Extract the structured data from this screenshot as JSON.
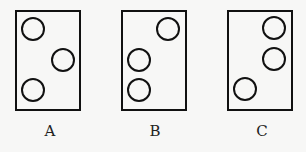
{
  "panels": [
    {
      "label": "A",
      "box": {
        "x": 16,
        "y": 11,
        "w": 64,
        "h": 99
      },
      "circles": [
        [
          33,
          29
        ],
        [
          63,
          60
        ],
        [
          33,
          90
        ]
      ],
      "label_x": 50
    },
    {
      "label": "B",
      "box": {
        "x": 122,
        "y": 11,
        "w": 64,
        "h": 99
      },
      "circles": [
        [
          168,
          29
        ],
        [
          139,
          60
        ],
        [
          139,
          90
        ]
      ],
      "label_x": 155
    },
    {
      "label": "C",
      "box": {
        "x": 228,
        "y": 11,
        "w": 64,
        "h": 99
      },
      "circles": [
        [
          274,
          28
        ],
        [
          274,
          59
        ],
        [
          245,
          89
        ]
      ],
      "label_x": 262
    }
  ],
  "circle_radius": 11,
  "stroke_color": "#111111"
}
